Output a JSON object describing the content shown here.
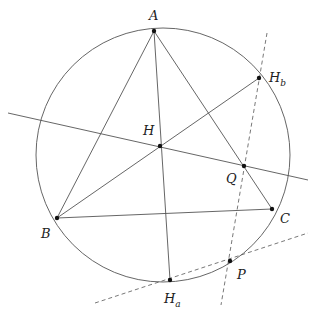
{
  "diagram": {
    "type": "geometry-construction",
    "colors": {
      "stroke": "#555555",
      "point": "#111111",
      "text": "#222222"
    },
    "circle": {
      "cx": 163,
      "cy": 155,
      "r": 127
    },
    "points": [
      {
        "id": "A",
        "label": "A",
        "sub": "",
        "x": 154,
        "y": 31,
        "lx": 149,
        "ly": 20
      },
      {
        "id": "B",
        "label": "B",
        "sub": "",
        "x": 57,
        "y": 218,
        "lx": 41,
        "ly": 238
      },
      {
        "id": "C",
        "label": "C",
        "sub": "",
        "x": 272,
        "y": 209,
        "lx": 280,
        "ly": 223
      },
      {
        "id": "H",
        "label": "H",
        "sub": "",
        "x": 160,
        "y": 146,
        "lx": 143,
        "ly": 135
      },
      {
        "id": "Q",
        "label": "Q",
        "sub": "",
        "x": 244,
        "y": 166,
        "lx": 226,
        "ly": 183
      },
      {
        "id": "Hb",
        "label": "H",
        "sub": "b",
        "x": 259,
        "y": 78,
        "lx": 269,
        "ly": 82
      },
      {
        "id": "Ha",
        "label": "H",
        "sub": "a",
        "x": 170,
        "y": 280,
        "lx": 164,
        "ly": 303
      },
      {
        "id": "P",
        "label": "P",
        "sub": "",
        "x": 230,
        "y": 261,
        "lx": 237,
        "ly": 279
      }
    ],
    "solid_segments": [
      {
        "name": "side-AB",
        "x1": 154,
        "y1": 31,
        "x2": 57,
        "y2": 218
      },
      {
        "name": "side-AC",
        "x1": 154,
        "y1": 31,
        "x2": 272,
        "y2": 209
      },
      {
        "name": "side-BC",
        "x1": 57,
        "y1": 218,
        "x2": 272,
        "y2": 209
      },
      {
        "name": "altitude-A-Ha",
        "x1": 154,
        "y1": 31,
        "x2": 170,
        "y2": 280
      },
      {
        "name": "line-B-Hb",
        "x1": 57,
        "y1": 218,
        "x2": 259,
        "y2": 78
      },
      {
        "name": "line-through-H-Q",
        "x1": 8,
        "y1": 113,
        "x2": 308,
        "y2": 180
      }
    ],
    "dashed_lines": [
      {
        "name": "dashed-line-Hb-Q-P",
        "x1": 267,
        "y1": 33,
        "x2": 221,
        "y2": 305
      },
      {
        "name": "dashed-line-Ha-P",
        "x1": 95,
        "y1": 303,
        "x2": 308,
        "y2": 233
      }
    ]
  }
}
